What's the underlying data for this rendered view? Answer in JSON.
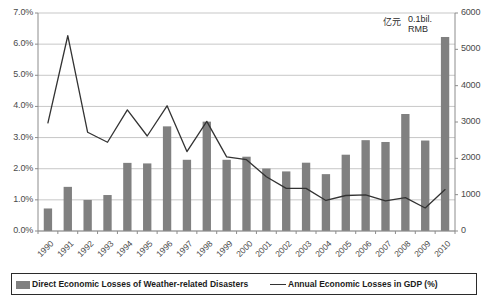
{
  "chart_data": {
    "type": "bar",
    "title": "",
    "subtitle": "",
    "xlabel": "",
    "ylabel": "",
    "grid": true,
    "legend_position": "bottom",
    "categories": [
      "1990",
      "1991",
      "1992",
      "1993",
      "1994",
      "1995",
      "1996",
      "1997",
      "1998",
      "1999",
      "2000",
      "2001",
      "2002",
      "2003",
      "2004",
      "2005",
      "2006",
      "2007",
      "2008",
      "2009",
      "2010"
    ],
    "axes": {
      "left": {
        "label": "",
        "ylim": [
          0,
          7
        ],
        "ticks": [
          "0.0%",
          "1.0%",
          "2.0%",
          "3.0%",
          "4.0%",
          "5.0%",
          "6.0%",
          "7.0%"
        ],
        "tick_values": [
          0,
          1,
          2,
          3,
          4,
          5,
          6,
          7
        ],
        "unit": "%"
      },
      "right": {
        "label": "",
        "ylim": [
          0,
          6000
        ],
        "ticks": [
          "0",
          "1000",
          "2000",
          "3000",
          "4000",
          "5000",
          "6000"
        ],
        "tick_values": [
          0,
          1000,
          2000,
          3000,
          4000,
          5000,
          6000
        ],
        "unit": "0.1bil. RMB"
      }
    },
    "series": [
      {
        "name": "Direct Economic Losses of Weather-related Disasters",
        "type": "bar",
        "axis": "right",
        "color": "#808080",
        "values": [
          620,
          1215,
          855,
          990,
          1875,
          1860,
          2880,
          1960,
          3010,
          1960,
          2045,
          1720,
          1640,
          1880,
          1565,
          2100,
          2500,
          2450,
          3220,
          2490,
          5340
        ]
      },
      {
        "name": "Annual Economic Losses in GDP (%)",
        "type": "line",
        "axis": "left",
        "color": "#333333",
        "values": [
          3.47,
          6.27,
          3.17,
          2.85,
          3.89,
          3.05,
          4.02,
          2.55,
          3.52,
          2.38,
          2.29,
          1.74,
          1.37,
          1.37,
          0.98,
          1.14,
          1.16,
          0.97,
          1.07,
          0.74,
          1.33
        ]
      }
    ],
    "annotations": [
      {
        "name": "unit-chinese",
        "text": "亿元"
      },
      {
        "name": "unit-english",
        "text": "0.1bil. RMB"
      }
    ]
  },
  "legend": {
    "bar_label": "Direct Economic Losses of Weather-related Disasters",
    "line_label": "Annual Economic Losses in GDP (%)"
  },
  "units": {
    "chinese": "亿元",
    "english_line1": "0.1bil.",
    "english_line2": "RMB"
  }
}
